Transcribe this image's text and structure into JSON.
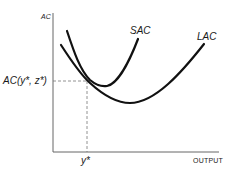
{
  "diagram": {
    "y_axis_label": "AC",
    "x_axis_label": "OUTPUT",
    "curves": [
      {
        "name": "SAC",
        "label": "SAC",
        "description": "Short-run average cost curve, U-shaped, steeper"
      },
      {
        "name": "LAC",
        "label": "LAC",
        "description": "Long-run average cost curve, U-shaped, flatter envelope"
      }
    ],
    "tangency_point": {
      "y_value_label": "AC(y*, z*)",
      "x_value_label": "y*"
    },
    "colors": {
      "curve": "#111111",
      "axis": "#555555",
      "dashed": "#777777",
      "text": "#1a1a1a"
    }
  }
}
